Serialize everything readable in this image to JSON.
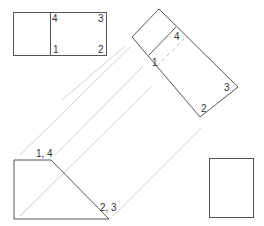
{
  "colors": {
    "outline": "#555555",
    "projection": "#cccccc",
    "hidden": "#bbbbbb",
    "label": "#333333"
  },
  "front_view": {
    "corner_labels": [
      "4",
      "3",
      "1",
      "2"
    ]
  },
  "auxiliary_view": {
    "corner_labels": [
      "4",
      "1",
      "3",
      "2"
    ]
  },
  "side_view": {
    "corner_labels": [
      "1, 4",
      "2, 3"
    ]
  },
  "end_view": {
    "corner_labels": []
  }
}
